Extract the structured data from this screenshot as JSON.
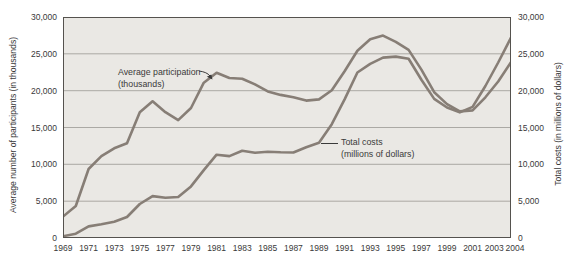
{
  "chart_data": {
    "type": "line",
    "title": "",
    "left_axis_title": "Average number of participants (in thousands)",
    "right_axis_title": "Total costs (in millions of dollars)",
    "x": [
      1969,
      1970,
      1971,
      1972,
      1973,
      1974,
      1975,
      1976,
      1977,
      1978,
      1979,
      1980,
      1981,
      1982,
      1983,
      1984,
      1985,
      1986,
      1987,
      1988,
      1989,
      1990,
      1991,
      1992,
      1993,
      1994,
      1995,
      1996,
      1997,
      1998,
      1999,
      2000,
      2001,
      2002,
      2003,
      2004
    ],
    "x_tick_labels": [
      "1969",
      "1971",
      "1973",
      "1975",
      "1977",
      "1979",
      "1981",
      "1983",
      "1985",
      "1987",
      "1989",
      "1991",
      "1993",
      "1995",
      "1997",
      "1999",
      "2001",
      "2003",
      "2004"
    ],
    "y_ticks": [
      0,
      5000,
      10000,
      15000,
      20000,
      25000,
      30000
    ],
    "y_tick_labels": [
      "0",
      "5,000",
      "10,000",
      "15,000",
      "20,000",
      "25,000",
      "30,000"
    ],
    "ylim": [
      0,
      30000
    ],
    "grid": "horizontal",
    "legend_position": "inline-annotations",
    "line_color": "#877e76",
    "plot_bg": "#eae8e4",
    "gridline_color": "#9b9893",
    "frame_color": "#55524e",
    "series": [
      {
        "name": "Average participation (thousands)",
        "axis": "left",
        "values": [
          2900,
          4340,
          9370,
          11100,
          12170,
          12860,
          17060,
          18550,
          17080,
          16000,
          17650,
          21080,
          22430,
          21720,
          21630,
          20850,
          19900,
          19430,
          19110,
          18650,
          18810,
          20050,
          22630,
          25410,
          26990,
          27470,
          26620,
          25540,
          22860,
          19790,
          18180,
          17190,
          17320,
          19100,
          21250,
          23860
        ]
      },
      {
        "name": "Total costs (millions of dollars)",
        "axis": "right",
        "values": [
          250,
          580,
          1580,
          1870,
          2210,
          2850,
          4620,
          5690,
          5460,
          5570,
          7000,
          9220,
          11310,
          11120,
          11850,
          11580,
          11700,
          11640,
          11600,
          12320,
          12930,
          15450,
          18810,
          22460,
          23650,
          24490,
          24620,
          24330,
          21490,
          18880,
          17710,
          17050,
          17790,
          20640,
          23820,
          27200
        ]
      }
    ],
    "annotations": [
      {
        "line1": "Average participation",
        "line2": "(thousands)"
      },
      {
        "line1": "Total costs",
        "line2": "(millions of dollars)"
      }
    ]
  }
}
